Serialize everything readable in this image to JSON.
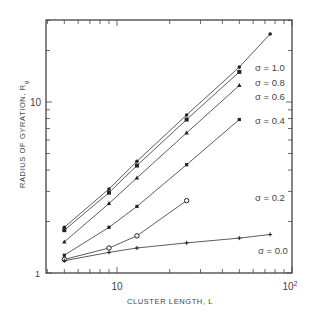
{
  "chart_data": {
    "type": "line",
    "title": "",
    "xlabel": "CLUSTER LENGTH, L",
    "ylabel": "RADIUS OF GYRATION, R",
    "ylabel_subscript": "g",
    "xscale": "log",
    "yscale": "log",
    "xlim": [
      3.9,
      100
    ],
    "ylim": [
      1,
      30
    ],
    "x_tick_labels": [
      "10",
      "10²"
    ],
    "y_tick_labels": [
      "1",
      "10"
    ],
    "grid": false,
    "legend_position": "inline-right",
    "series": [
      {
        "name": "σ = 1.0",
        "marker": "dot",
        "x": [
          5,
          9,
          13,
          25,
          50,
          75
        ],
        "y": [
          1.85,
          3.1,
          4.5,
          8.4,
          16.0,
          25.0
        ]
      },
      {
        "name": "σ = 0.8",
        "marker": "square",
        "x": [
          5,
          9,
          13,
          25,
          50
        ],
        "y": [
          1.78,
          2.95,
          4.25,
          7.9,
          15.0
        ]
      },
      {
        "name": "σ = 0.6",
        "marker": "triangle",
        "x": [
          5,
          9,
          13,
          25,
          50
        ],
        "y": [
          1.52,
          2.55,
          3.6,
          6.6,
          12.5
        ]
      },
      {
        "name": "σ = 0.4",
        "marker": "x",
        "x": [
          5,
          9,
          13,
          25,
          50
        ],
        "y": [
          1.27,
          1.85,
          2.45,
          4.3,
          7.9
        ]
      },
      {
        "name": "σ = 0.2",
        "marker": "circle",
        "x": [
          5,
          9,
          13,
          25
        ],
        "y": [
          1.2,
          1.4,
          1.65,
          2.65
        ]
      },
      {
        "name": "σ = 0.0",
        "marker": "plus",
        "x": [
          5,
          9,
          13,
          25,
          50,
          75
        ],
        "y": [
          1.18,
          1.32,
          1.4,
          1.5,
          1.6,
          1.68
        ]
      }
    ]
  },
  "labels": {
    "xlabel": "CLUSTER LENGTH, L",
    "ylabel": "RADIUS OF GYRATION, R",
    "ylabel_sub": "g",
    "x10": "10",
    "x100": "10",
    "x100_exp": "2",
    "y1": "1",
    "y10": "10",
    "s10": "σ = 1.0",
    "s08": "σ = 0.8",
    "s06": "σ = 0.6",
    "s04": "σ = 0.4",
    "s02": "σ = 0.2",
    "s00": "σ = 0.0"
  }
}
